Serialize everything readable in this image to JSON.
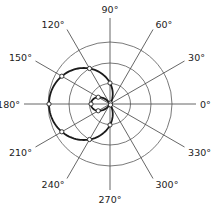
{
  "diagram": {
    "type": "polar-plot",
    "center": [
      110,
      104
    ],
    "grid_radii": [
      20.5,
      41,
      62
    ],
    "spoke_length": 86,
    "curve": {
      "a": 21,
      "b": 40,
      "color": "#1a1a1a"
    },
    "angles": [
      {
        "deg": 0,
        "label": "0°"
      },
      {
        "deg": 30,
        "label": "30°"
      },
      {
        "deg": 60,
        "label": "60°"
      },
      {
        "deg": 90,
        "label": "90°"
      },
      {
        "deg": 120,
        "label": "120°"
      },
      {
        "deg": 150,
        "label": "150°"
      },
      {
        "deg": 180,
        "label": "180°"
      },
      {
        "deg": 210,
        "label": "210°"
      },
      {
        "deg": 240,
        "label": "240°"
      },
      {
        "deg": 270,
        "label": "270°"
      },
      {
        "deg": 300,
        "label": "300°"
      },
      {
        "deg": 330,
        "label": "330°"
      }
    ],
    "marker_angles": [
      0,
      30,
      60,
      90,
      120,
      150,
      180,
      210,
      240,
      270,
      300,
      330
    ]
  }
}
